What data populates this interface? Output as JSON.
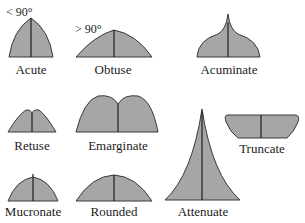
{
  "diagram": {
    "fill_color": "#a6a6a6",
    "outline_color": "#3a3a3a",
    "shapes": [
      {
        "id": "acute",
        "label": "Acute",
        "angle_note": "< 90°"
      },
      {
        "id": "obtuse",
        "label": "Obtuse",
        "angle_note": "> 90°"
      },
      {
        "id": "acuminate",
        "label": "Acuminate"
      },
      {
        "id": "retuse",
        "label": "Retuse"
      },
      {
        "id": "emarginate",
        "label": "Emarginate"
      },
      {
        "id": "truncate",
        "label": "Truncate"
      },
      {
        "id": "attenuate",
        "label": "Attenuate"
      },
      {
        "id": "mucronate",
        "label": "Mucronate"
      },
      {
        "id": "rounded",
        "label": "Rounded"
      }
    ]
  }
}
